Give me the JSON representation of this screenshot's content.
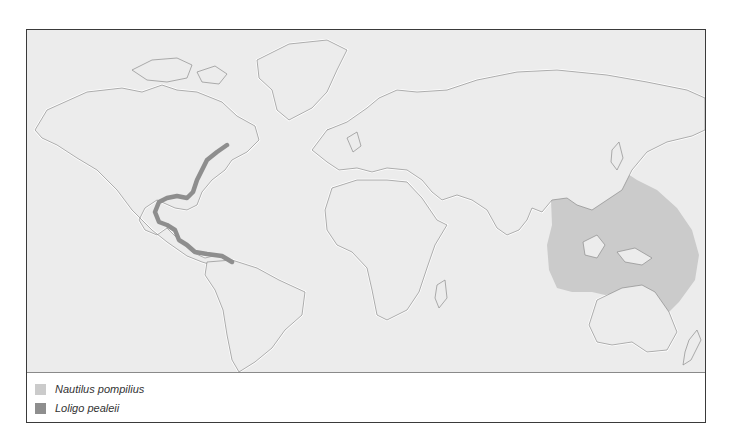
{
  "figure": {
    "type": "species-distribution-map",
    "map_background": "#ececec",
    "coastline_color": "#8c8c8c"
  },
  "ranges": [
    {
      "id": "nautilus",
      "species": "Nautilus pompilius",
      "color": "#cbcbcb",
      "region": "Indo-West Pacific: Philippines, Indonesia, New Guinea, northern Australia, Melanesia to Fiji/Samoa"
    },
    {
      "id": "loligo",
      "species": "Loligo pealeii",
      "color": "#8e8e8e",
      "region": "Western Atlantic: Nova Scotia south along US east coast, Gulf of Mexico, Caribbean coast to Venezuela"
    }
  ],
  "legend": {
    "items": [
      {
        "label": "Nautilus pompilius",
        "color": "#cbcbcb"
      },
      {
        "label": "Loligo pealeii",
        "color": "#8e8e8e"
      }
    ]
  }
}
